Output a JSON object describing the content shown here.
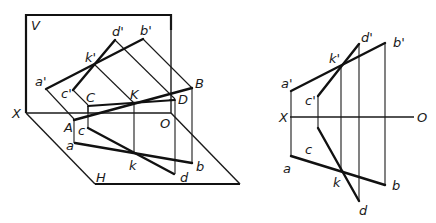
{
  "figure": {
    "colors": {
      "line": "#111111",
      "background": "#ffffff"
    }
  },
  "pictorial": {
    "planes": {
      "vertical_plane_label": "V",
      "horizontal_plane_label": "H",
      "axis_start_label": "X",
      "axis_end_label": "O"
    },
    "space_points": {
      "A": "A",
      "B": "B",
      "C": "C",
      "D": "D",
      "K": "K"
    },
    "front_projections": {
      "a": "a'",
      "b": "b'",
      "c": "c'",
      "d": "d'",
      "k": "k'"
    },
    "top_projections": {
      "a": "a",
      "b": "b",
      "c": "c",
      "d": "d",
      "k": "k"
    }
  },
  "orthographic": {
    "axis_start_label": "X",
    "axis_end_label": "O",
    "front_projections": {
      "a": "a'",
      "b": "b'",
      "c": "c'",
      "d": "d'",
      "k": "k'"
    },
    "top_projections": {
      "a": "a",
      "b": "b",
      "c": "c",
      "d": "d",
      "k": "k"
    }
  }
}
